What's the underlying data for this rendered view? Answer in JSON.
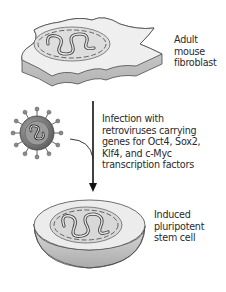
{
  "diagram": {
    "type": "process-flow"
  },
  "nodes": {
    "fibroblast": {
      "label_lines": [
        "Adult",
        "mouse",
        "fibroblast"
      ]
    },
    "infection": {
      "label_lines": [
        "Infection with",
        "retroviruses carrying",
        "genes for Oct4, Sox2,",
        "Klf4, and c-Myc",
        "transcription factors"
      ]
    },
    "ipsc": {
      "label_lines": [
        "Induced",
        "pluripotent",
        "stem cell"
      ]
    }
  },
  "edges": [
    {
      "from": "fibroblast",
      "to": "ipsc",
      "label": "infection",
      "style": "solid-arrow"
    },
    {
      "from": "retrovirus",
      "to": "arrow",
      "style": "curved-line"
    }
  ],
  "colors": {
    "outline": "#4a4a4a",
    "cell_top": "#eeeeee",
    "cell_side": "#c8c8c8",
    "nucleus": "#dcdcdc",
    "virus_body": "#7a7a7a",
    "arrow": "#111111",
    "text": "#2a2a2a"
  }
}
